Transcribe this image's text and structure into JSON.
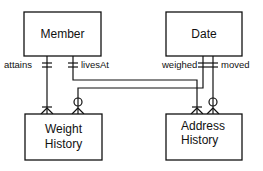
{
  "entities": [
    {
      "id": "member",
      "label": "Member"
    },
    {
      "id": "date",
      "label": "Date"
    },
    {
      "id": "weight_history",
      "label_lines": [
        "Weight",
        "History"
      ]
    },
    {
      "id": "address_history",
      "label_lines": [
        "Address",
        "History"
      ]
    }
  ],
  "relationships": [
    {
      "label": "attains",
      "from": "Member",
      "to": "Weight History",
      "from_cardinality": "one-and-only-one",
      "to_cardinality": "one-or-many"
    },
    {
      "label": "livesAt",
      "from": "Member",
      "to": "Address History",
      "from_cardinality": "one-and-only-one",
      "to_cardinality": "one-or-many"
    },
    {
      "label": "weighed",
      "from": "Date",
      "to": "Weight History",
      "from_cardinality": "one-and-only-one",
      "to_cardinality": "zero-or-many"
    },
    {
      "label": "moved",
      "from": "Date",
      "to": "Address History",
      "from_cardinality": "one-and-only-one",
      "to_cardinality": "zero-or-many"
    }
  ]
}
